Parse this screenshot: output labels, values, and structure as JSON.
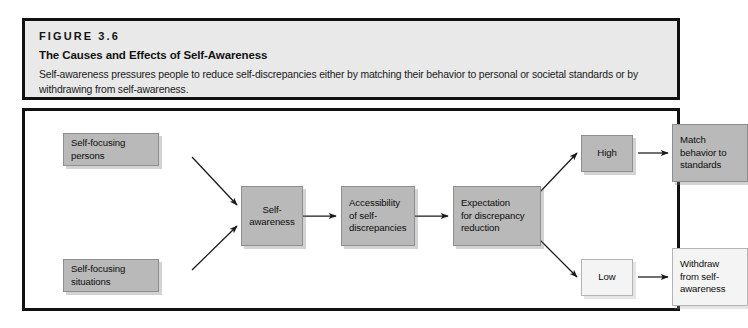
{
  "header": {
    "figure_number": "FIGURE 3.6",
    "title": "The Causes and Effects of Self-Awareness",
    "caption": "Self-awareness pressures people to reduce self-discrepancies either by matching their behavior to personal or societal standards or by withdrawing from self-awareness."
  },
  "colors": {
    "panel_border": "#111111",
    "header_background": "#e9e9e9",
    "node_gray": "#b9b9b9",
    "node_light": "#f4f4f4",
    "arrow": "#1a1a1a"
  },
  "diagram": {
    "type": "flowchart",
    "nodes": [
      {
        "id": "self_focusing_persons",
        "label": "Self-focusing\npersons",
        "fill": "gray"
      },
      {
        "id": "self_focusing_situations",
        "label": "Self-focusing\nsituations",
        "fill": "gray"
      },
      {
        "id": "self_awareness",
        "label": "Self-\nawareness",
        "fill": "gray"
      },
      {
        "id": "accessibility",
        "label": "Accessibility\nof self-\ndiscrepancies",
        "fill": "gray"
      },
      {
        "id": "expectation",
        "label": "Expectation\nfor discrepancy\nreduction",
        "fill": "gray"
      },
      {
        "id": "high",
        "label": "High",
        "fill": "gray"
      },
      {
        "id": "low",
        "label": "Low",
        "fill": "light"
      },
      {
        "id": "match_behavior",
        "label": "Match\nbehavior to\nstandards",
        "fill": "gray"
      },
      {
        "id": "withdraw",
        "label": "Withdraw\nfrom self-\nawareness",
        "fill": "light"
      }
    ],
    "edges": [
      {
        "from": "self_focusing_persons",
        "to": "self_awareness"
      },
      {
        "from": "self_focusing_situations",
        "to": "self_awareness"
      },
      {
        "from": "self_awareness",
        "to": "accessibility"
      },
      {
        "from": "accessibility",
        "to": "expectation"
      },
      {
        "from": "expectation",
        "to": "high"
      },
      {
        "from": "expectation",
        "to": "low"
      },
      {
        "from": "high",
        "to": "match_behavior"
      },
      {
        "from": "low",
        "to": "withdraw"
      }
    ]
  }
}
